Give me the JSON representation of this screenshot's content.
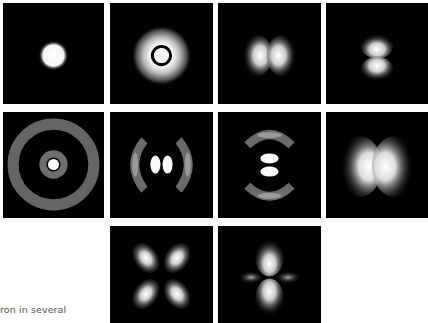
{
  "figure": {
    "caption_fragment": "ron in several",
    "background": "#ffffff",
    "panel_background": "#000000",
    "panels": [
      {
        "id": "r1c1",
        "row": 1,
        "col": 1,
        "pattern": "bright central disk"
      },
      {
        "id": "r1c2",
        "row": 1,
        "col": 2,
        "pattern": "bright core, dark node ring, bright outer ring"
      },
      {
        "id": "r1c3",
        "row": 1,
        "col": 3,
        "pattern": "two lobes, horizontal"
      },
      {
        "id": "r1c4",
        "row": 1,
        "col": 4,
        "pattern": "two lobes, vertical"
      },
      {
        "id": "r2c1",
        "row": 2,
        "col": 1,
        "pattern": "bright core, two concentric gray rings"
      },
      {
        "id": "r2c2",
        "row": 2,
        "col": 2,
        "pattern": "two inner lobes, two outer arcs, horizontal"
      },
      {
        "id": "r2c3",
        "row": 2,
        "col": 3,
        "pattern": "two inner lobes, two outer arcs, vertical"
      },
      {
        "id": "r2c4",
        "row": 2,
        "col": 4,
        "pattern": "two large lobes, horizontal"
      },
      {
        "id": "r3c2",
        "row": 3,
        "col": 2,
        "pattern": "four-leaf clover, diagonal"
      },
      {
        "id": "r3c3",
        "row": 3,
        "col": 3,
        "pattern": "two vertical lobes with torus ring"
      }
    ]
  }
}
